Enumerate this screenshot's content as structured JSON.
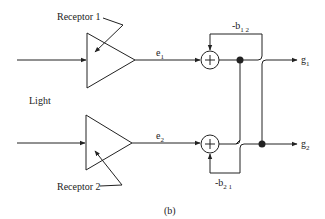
{
  "diagram": {
    "caption": "(b)",
    "input_label": "Light",
    "receptor1": {
      "label": "Receptor 1",
      "output": "e",
      "output_sub": "1"
    },
    "receptor2": {
      "label": "Receptor 2",
      "output": "e",
      "output_sub": "2"
    },
    "feedback_top": {
      "label": "-b",
      "sub": "1 2"
    },
    "feedback_bottom": {
      "label": "-b",
      "sub": "2 1"
    },
    "output1": {
      "label": "g",
      "sub": "1"
    },
    "output2": {
      "label": "g",
      "sub": "2"
    },
    "sum_symbol": "+",
    "colors": {
      "line": "#222222",
      "background": "#ffffff"
    }
  }
}
